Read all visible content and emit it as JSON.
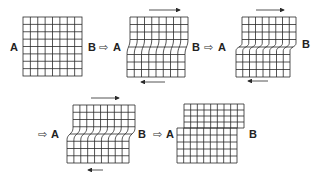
{
  "figure": {
    "label_left": "A",
    "label_right": "B",
    "step_arrow": "⇨",
    "panels": [
      {
        "id": 1,
        "state": "undeformed grid",
        "cells_x": 8,
        "cells_y": 8
      },
      {
        "id": 2,
        "state": "shear deformation in middle band",
        "top_arrow": "right",
        "bottom_arrow": "left"
      },
      {
        "id": 3,
        "state": "increased shear, upper block offset right",
        "top_arrow": "right",
        "bottom_arrow": "left"
      },
      {
        "id": 4,
        "state": "shear localized, strong offset",
        "top_arrow": "right",
        "bottom_arrow": "left"
      },
      {
        "id": 5,
        "state": "fault rupture, blocks displaced"
      }
    ]
  },
  "labels": {
    "p1": {
      "a": "A",
      "b": "B"
    },
    "p2": {
      "a": "A",
      "b": "B"
    },
    "p3": {
      "a": "A",
      "b": "B"
    },
    "p4": {
      "a": "A",
      "b": "B"
    },
    "p5": {
      "a": "A",
      "b": "B"
    },
    "step": "⇨"
  },
  "colors": {
    "line": "#2a2a2a",
    "background": "#ffffff"
  }
}
